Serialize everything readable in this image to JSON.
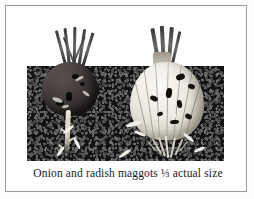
{
  "figure": {
    "caption": "Onion and radish maggots ⅓ actual size",
    "illustration": {
      "alt": "Black and white line illustration of a radish and an onion growing in soil, both damaged by maggots",
      "subjects": [
        {
          "name": "radish",
          "position": "left",
          "bulb_color": "#423a3a",
          "description": "dark radish bulb in soil with maggot tunnels and white taproot"
        },
        {
          "name": "onion",
          "position": "right",
          "bulb_color": "#eeebe2",
          "description": "pale onion bulb in soil with dark maggot holes and fibrous roots"
        }
      ],
      "soil_color": "#131313",
      "maggot_color": "#f2efe6",
      "scale_note": "⅓ actual size"
    }
  },
  "frame": {
    "border_color": "#9a9a9a",
    "page_color": "#ffffff"
  }
}
